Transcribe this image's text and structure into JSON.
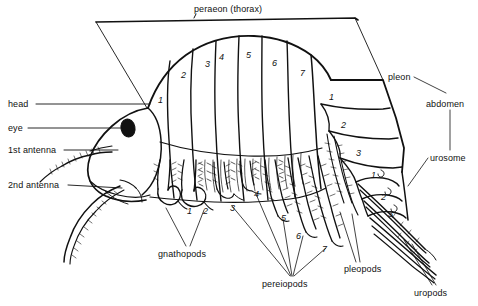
{
  "figure": {
    "background_color": "#ffffff",
    "ink_color": "#111111"
  },
  "labels": {
    "top": {
      "peraeon": "peraeon (thorax)"
    },
    "left": {
      "head": "head",
      "eye": "eye",
      "antenna1": "1st antenna",
      "antenna2": "2nd antenna"
    },
    "right": {
      "pleon": "pleon",
      "abdomen": "abdomen",
      "urosome": "urosome"
    },
    "bottom": {
      "gnathopods": "gnathopods",
      "pereiopods": "pereiopods",
      "pleopods": "pleopods",
      "uropods": "uropods"
    }
  },
  "segment_numbers": {
    "peraeon": [
      "1",
      "2",
      "3",
      "4",
      "5",
      "6",
      "7"
    ],
    "pleon": [
      "1",
      "2",
      "3"
    ],
    "urosome": [
      "1",
      "2",
      "3"
    ],
    "appendages": [
      "1",
      "2",
      "3",
      "4",
      "5",
      "6",
      "7"
    ]
  },
  "positions": {
    "peraeon_segments": [
      {
        "n": "1",
        "x": 158,
        "y": 95
      },
      {
        "n": "2",
        "x": 181,
        "y": 70
      },
      {
        "n": "3",
        "x": 205,
        "y": 59
      },
      {
        "n": "4",
        "x": 219,
        "y": 52
      },
      {
        "n": "5",
        "x": 246,
        "y": 50
      },
      {
        "n": "6",
        "x": 272,
        "y": 58
      },
      {
        "n": "7",
        "x": 300,
        "y": 68
      }
    ],
    "pleon_segments": [
      {
        "n": "1",
        "x": 329,
        "y": 92
      },
      {
        "n": "2",
        "x": 341,
        "y": 120
      },
      {
        "n": "3",
        "x": 356,
        "y": 148
      }
    ],
    "urosome_segments": [
      {
        "n": "1",
        "x": 371,
        "y": 170
      },
      {
        "n": "2",
        "x": 381,
        "y": 192
      },
      {
        "n": "3",
        "x": 388,
        "y": 209
      }
    ],
    "appendage_numbers": [
      {
        "n": "1",
        "x": 187,
        "y": 206
      },
      {
        "n": "2",
        "x": 203,
        "y": 206
      },
      {
        "n": "3",
        "x": 230,
        "y": 203
      },
      {
        "n": "4",
        "x": 254,
        "y": 189
      },
      {
        "n": "5",
        "x": 281,
        "y": 213
      },
      {
        "n": "6",
        "x": 296,
        "y": 231
      },
      {
        "n": "7",
        "x": 322,
        "y": 244
      }
    ],
    "text_labels": [
      {
        "key": "peraeon",
        "x": 194,
        "y": 9
      },
      {
        "key": "head",
        "x": 8,
        "y": 100
      },
      {
        "key": "eye",
        "x": 8,
        "y": 124
      },
      {
        "key": "antenna1",
        "x": 8,
        "y": 146
      },
      {
        "key": "antenna2",
        "x": 8,
        "y": 181
      },
      {
        "key": "pleon",
        "x": 388,
        "y": 74
      },
      {
        "key": "abdomen",
        "x": 430,
        "y": 100
      },
      {
        "key": "urosome",
        "x": 432,
        "y": 154
      },
      {
        "key": "gnathopods",
        "x": 160,
        "y": 251
      },
      {
        "key": "pereiopods",
        "x": 265,
        "y": 282
      },
      {
        "key": "pleopods",
        "x": 346,
        "y": 267
      },
      {
        "key": "uropods",
        "x": 418,
        "y": 290
      }
    ]
  }
}
